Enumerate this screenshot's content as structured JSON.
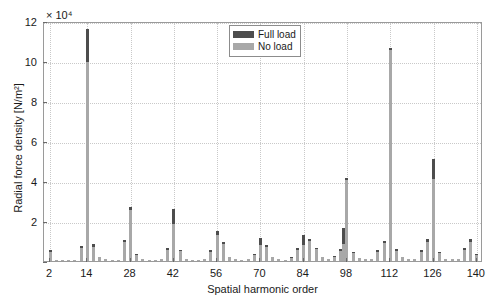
{
  "chart_data": {
    "type": "bar",
    "title": "",
    "xlabel": "Spatial harmonic order",
    "ylabel": "Radial force density [N/m²]",
    "y_exponent": "× 10⁴",
    "xlim": [
      0,
      142
    ],
    "ylim": [
      0,
      12
    ],
    "y_ticks": [
      0,
      2,
      4,
      6,
      8,
      10,
      12
    ],
    "y_tick_labels": [
      "",
      "2",
      "4",
      "6",
      "8",
      "10",
      "12"
    ],
    "x_ticks": [
      2,
      14,
      28,
      42,
      56,
      70,
      84,
      98,
      112,
      126,
      140
    ],
    "x_tick_labels": [
      "2",
      "14",
      "28",
      "42",
      "56",
      "70",
      "84",
      "98",
      "112",
      "126",
      "140"
    ],
    "grid": true,
    "legend_position": "top-center",
    "colors": {
      "full_load": "#4d4d4d",
      "no_load": "#a8a8a8",
      "axis": "#9a9a9a",
      "grid": "#c9c9c9"
    },
    "series": [
      {
        "name": "Full load",
        "color": "#4d4d4d"
      },
      {
        "name": "No load",
        "color": "#a8a8a8"
      }
    ],
    "stacked": true,
    "points": [
      {
        "x": 2,
        "no_load": 0.45,
        "full_load": 0.1
      },
      {
        "x": 4,
        "no_load": 0.07,
        "full_load": 0.0
      },
      {
        "x": 6,
        "no_load": 0.05,
        "full_load": 0.0
      },
      {
        "x": 8,
        "no_load": 0.06,
        "full_load": 0.0
      },
      {
        "x": 10,
        "no_load": 0.05,
        "full_load": 0.0
      },
      {
        "x": 12,
        "no_load": 0.65,
        "full_load": 0.1
      },
      {
        "x": 14,
        "no_load": 9.95,
        "full_load": 1.65
      },
      {
        "x": 16,
        "no_load": 0.72,
        "full_load": 0.12
      },
      {
        "x": 18,
        "no_load": 0.18,
        "full_load": 0.0
      },
      {
        "x": 20,
        "no_load": 0.08,
        "full_load": 0.0
      },
      {
        "x": 22,
        "no_load": 0.06,
        "full_load": 0.0
      },
      {
        "x": 24,
        "no_load": 0.05,
        "full_load": 0.0
      },
      {
        "x": 26,
        "no_load": 0.95,
        "full_load": 0.1
      },
      {
        "x": 28,
        "no_load": 2.55,
        "full_load": 0.15
      },
      {
        "x": 30,
        "no_load": 0.28,
        "full_load": 0.05
      },
      {
        "x": 32,
        "no_load": 0.1,
        "full_load": 0.0
      },
      {
        "x": 34,
        "no_load": 0.06,
        "full_load": 0.0
      },
      {
        "x": 36,
        "no_load": 0.05,
        "full_load": 0.0
      },
      {
        "x": 38,
        "no_load": 0.1,
        "full_load": 0.0
      },
      {
        "x": 40,
        "no_load": 0.55,
        "full_load": 0.08
      },
      {
        "x": 42,
        "no_load": 1.85,
        "full_load": 0.75
      },
      {
        "x": 44,
        "no_load": 0.48,
        "full_load": 0.08
      },
      {
        "x": 46,
        "no_load": 0.12,
        "full_load": 0.0
      },
      {
        "x": 48,
        "no_load": 0.06,
        "full_load": 0.0
      },
      {
        "x": 50,
        "no_load": 0.06,
        "full_load": 0.0
      },
      {
        "x": 52,
        "no_load": 0.08,
        "full_load": 0.0
      },
      {
        "x": 54,
        "no_load": 0.45,
        "full_load": 0.08
      },
      {
        "x": 56,
        "no_load": 1.3,
        "full_load": 0.2
      },
      {
        "x": 58,
        "no_load": 0.85,
        "full_load": 0.1
      },
      {
        "x": 60,
        "no_load": 0.18,
        "full_load": 0.0
      },
      {
        "x": 62,
        "no_load": 0.08,
        "full_load": 0.0
      },
      {
        "x": 64,
        "no_load": 0.06,
        "full_load": 0.0
      },
      {
        "x": 66,
        "no_load": 0.08,
        "full_load": 0.0
      },
      {
        "x": 68,
        "no_load": 0.3,
        "full_load": 0.05
      },
      {
        "x": 70,
        "no_load": 0.78,
        "full_load": 0.35
      },
      {
        "x": 72,
        "no_load": 0.68,
        "full_load": 0.1
      },
      {
        "x": 74,
        "no_load": 0.2,
        "full_load": 0.0
      },
      {
        "x": 76,
        "no_load": 0.08,
        "full_load": 0.0
      },
      {
        "x": 78,
        "no_load": 0.06,
        "full_load": 0.0
      },
      {
        "x": 80,
        "no_load": 0.15,
        "full_load": 0.05
      },
      {
        "x": 82,
        "no_load": 0.55,
        "full_load": 0.12
      },
      {
        "x": 84,
        "no_load": 0.8,
        "full_load": 0.5
      },
      {
        "x": 86,
        "no_load": 1.0,
        "full_load": 0.12
      },
      {
        "x": 88,
        "no_load": 0.62,
        "full_load": 0.05
      },
      {
        "x": 90,
        "no_load": 0.22,
        "full_load": 0.0
      },
      {
        "x": 92,
        "no_load": 0.08,
        "full_load": 0.0
      },
      {
        "x": 94,
        "no_load": 0.18,
        "full_load": 0.05
      },
      {
        "x": 96,
        "no_load": 0.52,
        "full_load": 0.08
      },
      {
        "x": 97,
        "no_load": 0.85,
        "full_load": 0.8
      },
      {
        "x": 98,
        "no_load": 4.05,
        "full_load": 0.12
      },
      {
        "x": 100,
        "no_load": 0.42,
        "full_load": 0.05
      },
      {
        "x": 102,
        "no_load": 0.15,
        "full_load": 0.0
      },
      {
        "x": 104,
        "no_load": 0.08,
        "full_load": 0.0
      },
      {
        "x": 106,
        "no_load": 0.1,
        "full_load": 0.0
      },
      {
        "x": 108,
        "no_load": 0.45,
        "full_load": 0.08
      },
      {
        "x": 110,
        "no_load": 0.9,
        "full_load": 0.12
      },
      {
        "x": 112,
        "no_load": 10.55,
        "full_load": 0.1
      },
      {
        "x": 114,
        "no_load": 0.5,
        "full_load": 0.08
      },
      {
        "x": 116,
        "no_load": 0.18,
        "full_load": 0.0
      },
      {
        "x": 118,
        "no_load": 0.08,
        "full_load": 0.0
      },
      {
        "x": 120,
        "no_load": 0.08,
        "full_load": 0.0
      },
      {
        "x": 122,
        "no_load": 0.45,
        "full_load": 0.08
      },
      {
        "x": 124,
        "no_load": 0.95,
        "full_load": 0.15
      },
      {
        "x": 126,
        "no_load": 4.1,
        "full_load": 1.0
      },
      {
        "x": 128,
        "no_load": 0.38,
        "full_load": 0.05
      },
      {
        "x": 130,
        "no_load": 0.12,
        "full_load": 0.0
      },
      {
        "x": 132,
        "no_load": 0.08,
        "full_load": 0.0
      },
      {
        "x": 134,
        "no_load": 0.1,
        "full_load": 0.0
      },
      {
        "x": 136,
        "no_load": 0.55,
        "full_load": 0.08
      },
      {
        "x": 138,
        "no_load": 0.95,
        "full_load": 0.15
      },
      {
        "x": 140,
        "no_load": 0.3,
        "full_load": 0.05
      }
    ]
  },
  "legend": {
    "entries": [
      {
        "label": "Full load"
      },
      {
        "label": "No load"
      }
    ]
  }
}
